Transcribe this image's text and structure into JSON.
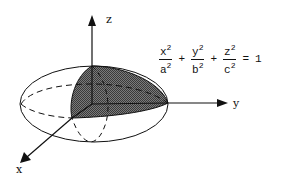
{
  "diagram": {
    "axes": {
      "x": "x",
      "y": "y",
      "z": "z"
    },
    "equation": {
      "terms": [
        {
          "num": "x",
          "den": "a",
          "exp": "2"
        },
        {
          "num": "y",
          "den": "b",
          "exp": "2"
        },
        {
          "num": "z",
          "den": "c",
          "exp": "2"
        }
      ],
      "plus": "+",
      "equals": "=",
      "rhs": "1"
    },
    "colors": {
      "stroke": "#111111",
      "shade": "#555555",
      "background": "#ffffff"
    }
  }
}
